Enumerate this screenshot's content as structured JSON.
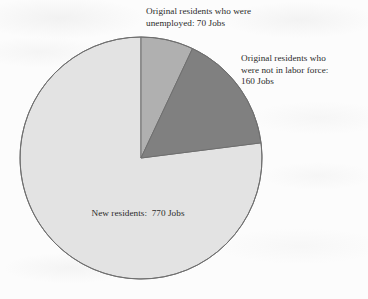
{
  "chart_data": {
    "type": "pie",
    "title": "",
    "subtitle": "",
    "xlabel": "",
    "ylabel": "",
    "unit": "Jobs",
    "total": 1000,
    "legend_position": "none",
    "grid": false,
    "start_angle_deg": 0,
    "direction": "clockwise",
    "center": {
      "x": 141,
      "y": 158
    },
    "radius": 121,
    "categories": [
      "Original residents who were unemployed",
      "Original residents who were not in labor force",
      "New residents"
    ],
    "values": [
      70,
      160,
      770
    ],
    "percentages": [
      7.0,
      16.0,
      77.0
    ],
    "angles_deg": [
      25.2,
      57.6,
      277.2
    ],
    "colors": [
      "#b0b0b0",
      "#808080",
      "#e3e3e3"
    ],
    "slices": [
      {
        "label": "Original residents who were unemployed",
        "value": 70,
        "percent": 7.0,
        "angle_deg": 25.2,
        "color": "#b0b0b0",
        "label_text": "Original residents who were\nunemployed: 70 Jobs"
      },
      {
        "label": "Original residents who were not in labor force",
        "value": 160,
        "percent": 16.0,
        "angle_deg": 57.6,
        "color": "#808080",
        "label_text": "Original residents who\nwere not in labor force:\n160 Jobs"
      },
      {
        "label": "New residents",
        "value": 770,
        "percent": 77.0,
        "angle_deg": 277.2,
        "color": "#e3e3e3",
        "label_text": "New residents:  770 Jobs"
      }
    ],
    "annotations": [
      "Original residents who were unemployed: 70 Jobs",
      "Original residents who were not in labor force: 160 Jobs",
      "New residents:  770 Jobs"
    ]
  },
  "labels": {
    "unemployed": "Original residents who were\nunemployed: 70 Jobs",
    "not_in_labor_force": "Original residents who\nwere not in labor force:\n160 Jobs",
    "new_residents": "New residents:  770 Jobs"
  },
  "style": {
    "background": "#fcfcfc",
    "outline": "#6f6f6f",
    "text_color": "#2a2a2a"
  }
}
